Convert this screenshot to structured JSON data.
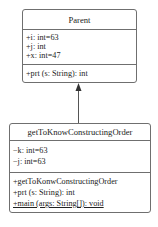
{
  "diagram": {
    "type": "uml-class-diagram",
    "relationship": "generalization",
    "classes": [
      {
        "id": "parent",
        "name": "Parent",
        "attributes": [
          "+i: int=63",
          "+j: int",
          "+x: int=47"
        ],
        "operations": [
          "+prt (s: String): int"
        ]
      },
      {
        "id": "child",
        "name": "getToKnowConstructingOrder",
        "attributes": [
          "−k: int=63",
          "−j: int=63"
        ],
        "operations": [
          "+getToKonwConstructingOrder",
          "+prt (s: String): int",
          "+main (args: String[]): void"
        ]
      }
    ],
    "edge": {
      "from": "getToKnowConstructingOrder",
      "to": "Parent",
      "arrow": "filled-arrowhead",
      "color": "#555555"
    },
    "colors": {
      "border": "#6f6f6f",
      "text": "#222222",
      "background": "#ffffff"
    }
  }
}
